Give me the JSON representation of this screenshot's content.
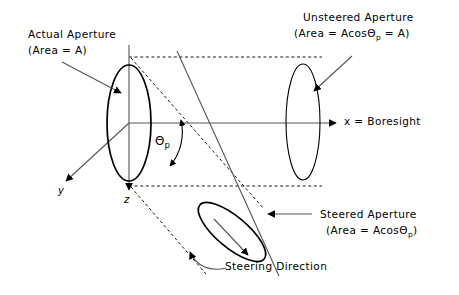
{
  "figure": {
    "background_color": "#ffffff",
    "line_color": "#000000",
    "width": 459,
    "height": 295
  },
  "labels": {
    "actual_aperture_line1": "Actual Aperture",
    "actual_aperture_line2": "(Area = A)",
    "unsteered_aperture_line1": "Unsteered Aperture",
    "unsteered_aperture_line2_pre": "(Area = Acos",
    "unsteered_aperture_theta": "Θ",
    "unsteered_aperture_sub": "p",
    "unsteered_aperture_line2_post": " = A)",
    "steered_aperture_line1": "Steered Aperture",
    "steered_aperture_line2_pre": "(Area = Acos",
    "steered_aperture_theta": "Θ",
    "steered_aperture_sub": "p",
    "steered_aperture_line2_post": ")",
    "steering_direction": "Steering Direction",
    "boresight": "x = Boresight",
    "axis_y": "y",
    "axis_z": "z",
    "angle_theta": "Θ",
    "angle_theta_sub": "p"
  },
  "geometry": {
    "actual_aperture": {
      "cx": 129,
      "cy": 123,
      "rx": 22,
      "ry": 58,
      "rotation": 0,
      "stroke_width": 1.6
    },
    "unsteered_aperture": {
      "cx": 303,
      "cy": 122,
      "rx": 17,
      "ry": 58,
      "rotation": 0,
      "stroke_width": 1.1
    },
    "steered_aperture": {
      "cx": 232,
      "cy": 232,
      "rx": 16,
      "ry": 42,
      "rotation": -50,
      "stroke_width": 1.6
    },
    "boresight_axis": {
      "x1": 129,
      "y1": 123,
      "x2": 340,
      "y2": 123
    },
    "z_axis": {
      "x1": 129,
      "y1": 45,
      "x2": 129,
      "y2": 196
    },
    "y_axis": {
      "x1": 129,
      "y1": 123,
      "x2": 62,
      "y2": 185
    },
    "steering_axis": {
      "x1": 176,
      "y1": 52,
      "x2": 278,
      "y2": 275
    },
    "dashed_top": {
      "x1": 129,
      "y1": 57,
      "x2": 320,
      "y2": 57
    },
    "dashed_bottom": {
      "x1": 129,
      "y1": 186,
      "x2": 320,
      "y2": 186
    },
    "dashed_proj_top": {
      "x1": 129,
      "y1": 57,
      "x2": 262,
      "y2": 207
    },
    "dashed_proj_bottom": {
      "x1": 129,
      "y1": 186,
      "x2": 205,
      "y2": 272
    },
    "theta_arc": {
      "cx": 129,
      "cy": 123,
      "radius": 53
    }
  },
  "annotations": {
    "actual_leader": {
      "x1": 62,
      "y1": 62,
      "x2": 122,
      "y2": 94
    },
    "unsteered_leader": {
      "x1": 350,
      "y1": 57,
      "x2": 313,
      "y2": 92
    },
    "steered_leader": {
      "x1": 310,
      "y1": 214,
      "x2": 265,
      "y2": 214
    },
    "steering_dir_arrow": {
      "x1": 216,
      "y1": 222,
      "x2": 250,
      "y2": 256
    }
  }
}
